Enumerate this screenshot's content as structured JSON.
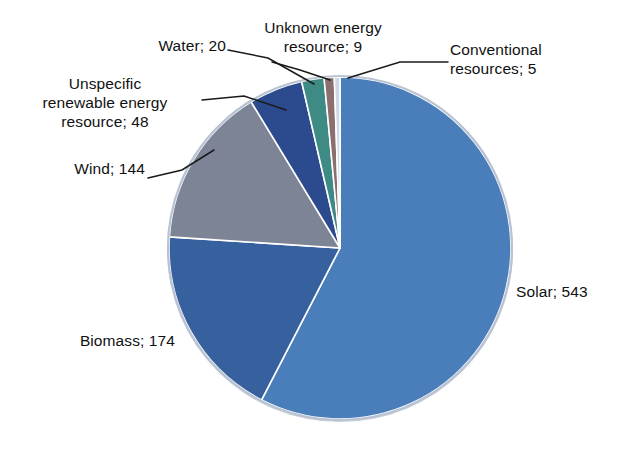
{
  "chart_data": {
    "type": "pie",
    "title": "",
    "subtitle": "",
    "xlabel": "",
    "ylabel": "",
    "legend_position": "none",
    "grid": false,
    "label_format": "name; value",
    "total": 943,
    "start_angle_deg": 0,
    "direction": "clockwise",
    "categories": [
      "Solar",
      "Biomass",
      "Wind",
      "Unspecific renewable energy resource",
      "Water",
      "Unknown energy resource",
      "Conventional resources"
    ],
    "values": [
      543,
      174,
      144,
      48,
      20,
      9,
      5
    ],
    "colors": [
      "#4a7ebb",
      "#37609e",
      "#7d8495",
      "#2c4b8e",
      "#3e8a85",
      "#8a6f6e",
      "#cdd9ea"
    ],
    "slices": [
      {
        "name": "Solar",
        "value": 543,
        "label": "Solar; 543",
        "color": "#4a7ebb",
        "percent": 57.6,
        "start_deg": 0,
        "sweep_deg": 207.3
      },
      {
        "name": "Biomass",
        "value": 174,
        "label": "Biomass; 174",
        "color": "#37609e",
        "percent": 18.5,
        "start_deg": 207.3,
        "sweep_deg": 66.4
      },
      {
        "name": "Wind",
        "value": 144,
        "label": "Wind; 144",
        "color": "#7d8495",
        "percent": 15.3,
        "start_deg": 273.7,
        "sweep_deg": 55.0
      },
      {
        "name": "Unspecific renewable energy resource",
        "value": 48,
        "label": "Unspecific\nrenewable energy\nresource; 48",
        "color": "#2c4b8e",
        "percent": 5.1,
        "start_deg": 328.7,
        "sweep_deg": 18.3
      },
      {
        "name": "Water",
        "value": 20,
        "label": "Water; 20",
        "color": "#3e8a85",
        "percent": 2.1,
        "start_deg": 347.0,
        "sweep_deg": 7.6
      },
      {
        "name": "Unknown energy resource",
        "value": 9,
        "label": "Unknown energy\nresource; 9",
        "color": "#8a6f6e",
        "percent": 1.0,
        "start_deg": 354.6,
        "sweep_deg": 3.4
      },
      {
        "name": "Conventional resources",
        "value": 5,
        "label": "Conventional\nresources; 5",
        "color": "#cdd9ea",
        "percent": 0.5,
        "start_deg": 358.0,
        "sweep_deg": 1.9
      }
    ]
  },
  "labels": {
    "solar": "Solar; 543",
    "biomass": "Biomass; 174",
    "wind": "Wind; 144",
    "unspecific": "Unspecific\nrenewable energy\nresource; 48",
    "water": "Water; 20",
    "unknown": "Unknown energy\nresource; 9",
    "conventional": "Conventional\nresources; 5"
  },
  "style": {
    "background": "#ffffff",
    "slice_border": "#ffffff",
    "leader_line": "#1a1a1a",
    "text": "#111111",
    "pie_rim": "#b9c3d2"
  }
}
